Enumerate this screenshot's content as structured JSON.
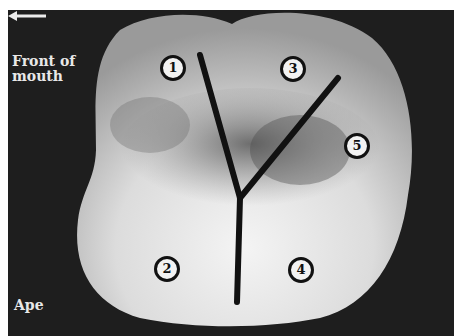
{
  "figure": {
    "direction_label": "Front of mouth",
    "direction_arrow": "left-arrow",
    "specimen_label": "Ape",
    "cusps": [
      {
        "number": "1",
        "x": 170,
        "y": 65
      },
      {
        "number": "2",
        "x": 164,
        "y": 266
      },
      {
        "number": "3",
        "x": 290,
        "y": 66
      },
      {
        "number": "4",
        "x": 298,
        "y": 267
      },
      {
        "number": "5",
        "x": 354,
        "y": 143
      }
    ],
    "fissure_pattern": "Y-shaped (Y-5 pattern)",
    "colors": {
      "background": "#1e1e1e",
      "tooth": "#d8d8d8",
      "lines": "#111111",
      "text": "#e8e8e8"
    }
  }
}
